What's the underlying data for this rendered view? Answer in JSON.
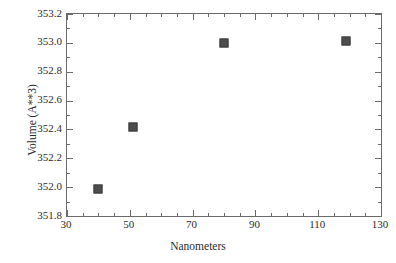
{
  "chart_data": {
    "type": "scatter",
    "title": "",
    "subtitle": "",
    "xlabel": "Nanometers",
    "ylabel": "Volume (A**3)",
    "xlim": [
      30,
      130
    ],
    "ylim": [
      351.8,
      353.2
    ],
    "grid": false,
    "legend": null,
    "x_major_ticks": [
      30,
      50,
      70,
      90,
      110,
      130
    ],
    "x_major_tick_labels": [
      "30",
      "50",
      "70",
      "90",
      "110",
      "130"
    ],
    "x_minor_tick_step": 5,
    "y_major_ticks": [
      351.8,
      352.0,
      352.2,
      352.4,
      352.6,
      352.8,
      353.0,
      353.2
    ],
    "y_major_tick_labels": [
      "351.8",
      "352.0",
      "352.2",
      "352.4",
      "352.6",
      "352.8",
      "353.0",
      "353.2"
    ],
    "y_minor_tick_step": 0.1,
    "marker_color": "#4d4d4d",
    "marker_shape": "square",
    "axis_color": "#6a6a6a",
    "text_color": "#2b2b2b",
    "background_color": "#ffffff",
    "series": [
      {
        "name": "Volume vs Nanometers",
        "x": [
          40,
          51,
          80,
          119
        ],
        "y": [
          351.99,
          352.42,
          353.0,
          353.01
        ]
      }
    ]
  }
}
